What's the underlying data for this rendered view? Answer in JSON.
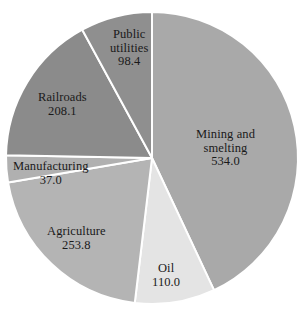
{
  "chart_data": {
    "type": "pie",
    "title": "",
    "total": 1241.3,
    "start_angle_deg": 0,
    "direction": "clockwise",
    "legend": "none",
    "labels_placement": "inside-slice",
    "categories": [
      "Mining and smelting",
      "Oil",
      "Agriculture",
      "Manufacturing",
      "Railroads",
      "Public utilities"
    ],
    "values": [
      534.0,
      110.0,
      253.8,
      37.0,
      208.1,
      98.4
    ],
    "slices": [
      {
        "name": "Mining and smelting",
        "name_line1": "Mining and",
        "name_line2": "smelting",
        "value": "534.0",
        "value_num": 534.0,
        "percent": 43.0,
        "angle_deg": 154.9,
        "color": "#a9a9a9",
        "label_x": 196,
        "label_y": 128
      },
      {
        "name": "Oil",
        "name_line1": "Oil",
        "name_line2": "",
        "value": "110.0",
        "value_num": 110.0,
        "percent": 8.9,
        "angle_deg": 31.9,
        "color": "#e4e4e4",
        "label_x": 152,
        "label_y": 262
      },
      {
        "name": "Agriculture",
        "name_line1": "Agriculture",
        "name_line2": "",
        "value": "253.8",
        "value_num": 253.8,
        "percent": 20.4,
        "angle_deg": 73.6,
        "color": "#b4b4b4",
        "label_x": 47,
        "label_y": 225
      },
      {
        "name": "Manufacturing",
        "name_line1": "Manufacturing",
        "name_line2": "",
        "value": "37.0",
        "value_num": 37.0,
        "percent": 3.0,
        "angle_deg": 10.7,
        "color": "#b0b0b0",
        "label_x": 13,
        "label_y": 160
      },
      {
        "name": "Railroads",
        "name_line1": "Railroads",
        "name_line2": "",
        "value": "208.1",
        "value_num": 208.1,
        "percent": 16.8,
        "angle_deg": 60.4,
        "color": "#8b8b8b",
        "label_x": 38,
        "label_y": 91
      },
      {
        "name": "Public utilities",
        "name_line1": "Public",
        "name_line2": "utilities",
        "value": "98.4",
        "value_num": 98.4,
        "percent": 7.9,
        "angle_deg": 28.5,
        "color": "#8f8f8f",
        "label_x": 110,
        "label_y": 28
      }
    ],
    "geometry": {
      "cx": 152,
      "cy": 158,
      "r": 146,
      "separator_color": "#ffffff",
      "separator_width": 2
    },
    "background": "#ffffff"
  }
}
